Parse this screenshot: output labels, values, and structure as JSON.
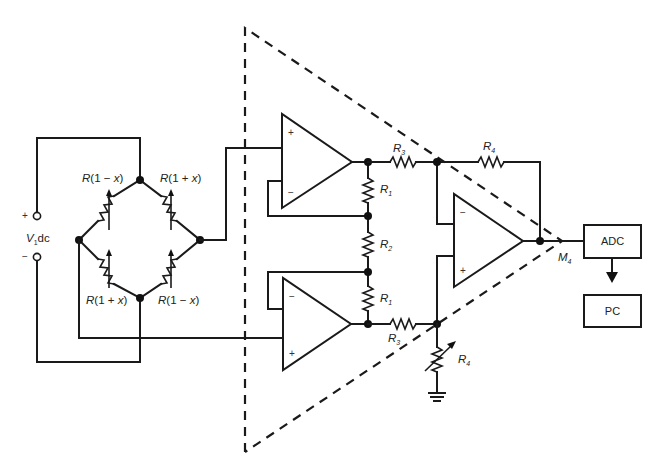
{
  "diagram": {
    "type": "circuit-schematic",
    "source": {
      "label": "V",
      "label_sub": "1",
      "label_suffix": "dc",
      "plus_sign": "+",
      "minus_sign": "−"
    },
    "bridge": {
      "top_left": "R(1 − x)",
      "top_right": "R(1 + x)",
      "bottom_left": "R(1 + x)",
      "bottom_right": "R(1 − x)"
    },
    "amplifier": {
      "opamp_top": {
        "plus": "+",
        "minus": "−"
      },
      "opamp_bottom": {
        "plus": "+",
        "minus": "−"
      },
      "opamp_out": {
        "plus": "+",
        "minus": "−"
      },
      "resistors": {
        "r1_top": {
          "name": "R",
          "sub": "1"
        },
        "r2": {
          "name": "R",
          "sub": "2"
        },
        "r1_bottom": {
          "name": "R",
          "sub": "1"
        },
        "r3_top": {
          "name": "R",
          "sub": "3"
        },
        "r3_bottom": {
          "name": "R",
          "sub": "3"
        },
        "r4_feedback": {
          "name": "R",
          "sub": "4"
        },
        "r4_variable": {
          "name": "R",
          "sub": "4"
        }
      },
      "output_label": {
        "name": "M",
        "sub": "4"
      }
    },
    "blocks": {
      "adc": "ADC",
      "pc": "PC"
    }
  },
  "colors": {
    "ink": "#1a1a1a",
    "background": "#ffffff"
  }
}
